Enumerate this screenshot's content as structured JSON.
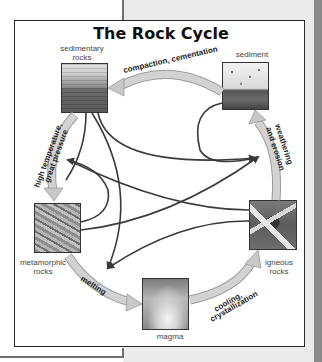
{
  "title": "The Rock Cycle",
  "nodes": {
    "sedimentary": {
      "line1": "sedimentary",
      "line2": "rocks"
    },
    "sediment": {
      "line1": "sediment"
    },
    "metamorphic": {
      "line1": "metamorphic",
      "line2": "rocks"
    },
    "igneous": {
      "line1": "igneous",
      "line2": "rocks"
    },
    "magma": {
      "line1": "magma"
    }
  },
  "processes": {
    "compaction": "compaction, cementation",
    "weathering_1": "weathering",
    "weathering_2": "and erosion",
    "pressure_1": "high temperature,",
    "pressure_2": "great pressure",
    "melting": "melting",
    "cooling_1": "cooling,",
    "cooling_2": "crystallization"
  },
  "colors": {
    "cycle_arrow": "#c8c8c8",
    "cycle_arrow_edge": "#9a9a9a",
    "path_arrow": "#3a3a3a",
    "panel_bg": "#ebebeb",
    "border": "#2a2a2a"
  }
}
